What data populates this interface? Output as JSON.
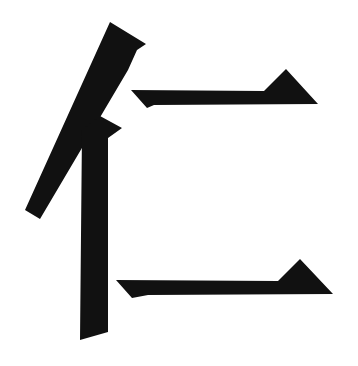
{
  "character": "仁",
  "colors": {
    "ink": "#111111",
    "background": "#ffffff"
  },
  "strokes": [
    {
      "name": "left-falling",
      "points": "110,22 146,44 137,50 128,70 40,219 25,210"
    },
    {
      "name": "vertical",
      "points": "82,130 100,116 122,128 108,138 108,332 80,340"
    },
    {
      "name": "upper-horizontal",
      "points": "131,90 264,91 286,69 318,104 154,105 147,108"
    },
    {
      "name": "lower-horizontal",
      "points": "116,280 278,281 300,259 333,294 148,295 132,298"
    }
  ]
}
